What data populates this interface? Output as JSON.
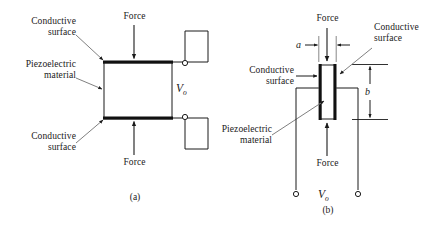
{
  "figure": {
    "background_color": "#ffffff",
    "line_color": "#1a1a1a",
    "electrode_color": "#111111"
  },
  "panel_a": {
    "caption": "(a)",
    "labels": {
      "top_conductive": "Conductive\nsurface",
      "piezo": "Piezoelectric\nmaterial",
      "bottom_conductive": "Conductive\nsurface",
      "force_top": "Force",
      "force_bottom": "Force"
    },
    "output": {
      "symbol": "V",
      "subscript": "o"
    },
    "icons": {
      "force_arrow_top": "arrow-down-icon",
      "force_arrow_bottom": "arrow-up-icon",
      "terminal_top": "terminal-node-icon",
      "terminal_bottom": "terminal-node-icon"
    }
  },
  "panel_b": {
    "caption": "(b)",
    "labels": {
      "force_top": "Force",
      "force_bottom": "Force",
      "left_conductive": "Conductive\nsurface",
      "right_conductive": "Conductive\nsurface",
      "piezo": "Piezoelectric\nmaterial"
    },
    "dimensions": {
      "width_label": "a",
      "height_label": "b"
    },
    "output": {
      "symbol": "V",
      "subscript": "o"
    },
    "icons": {
      "force_arrow_top": "arrow-down-icon",
      "force_arrow_bottom": "arrow-up-icon",
      "dim_arrow_a_left": "arrow-right-icon",
      "dim_arrow_a_right": "arrow-left-icon",
      "dim_arrow_b_up": "arrow-up-icon",
      "dim_arrow_b_down": "arrow-down-icon",
      "terminal_left": "terminal-node-icon",
      "terminal_right": "terminal-node-icon"
    }
  }
}
